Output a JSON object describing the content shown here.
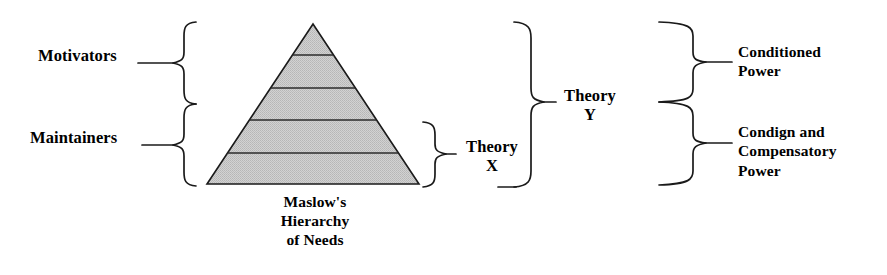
{
  "diagram": {
    "pyramid": {
      "caption": "Maslow's\nHierarchy\nof Needs",
      "levels": 5,
      "fill_color": "#c9c9c9",
      "stroke_color": "#1a1a1a",
      "apex": {
        "x": 313,
        "y": 24
      },
      "base_left": {
        "x": 207,
        "y": 184
      },
      "base_right": {
        "x": 419,
        "y": 184
      },
      "divider_y": [
        55,
        88,
        120,
        153
      ]
    },
    "left_labels": {
      "motivators": "Motivators",
      "maintainers": "Maintainers"
    },
    "middle_labels": {
      "theory_x": "Theory\nX",
      "theory_y": "Theory\nY"
    },
    "right_labels": {
      "conditioned_power": "Conditioned\nPower",
      "condign_power": "Condign and\nCompensatory\nPower"
    },
    "braces": [
      {
        "name": "motivators-brace",
        "orientation": "left-pointing",
        "span_top": 22,
        "span_bottom": 104,
        "tip_y": 63
      },
      {
        "name": "maintainers-brace",
        "orientation": "left-pointing",
        "span_top": 104,
        "span_bottom": 186,
        "tip_y": 145
      },
      {
        "name": "theory-x-brace",
        "orientation": "right-pointing",
        "span_top": 122,
        "span_bottom": 187,
        "tip_y": 154
      },
      {
        "name": "theory-y-brace",
        "orientation": "right-pointing",
        "span_top": 22,
        "span_bottom": 187,
        "tip_y": 102
      },
      {
        "name": "conditioned-power-brace",
        "orientation": "right-pointing",
        "span_top": 22,
        "span_bottom": 102,
        "tip_y": 62
      },
      {
        "name": "condign-power-brace",
        "orientation": "right-pointing",
        "span_top": 102,
        "span_bottom": 185,
        "tip_y": 143
      }
    ],
    "colors": {
      "ink": "#1a1a1a",
      "pyramid_fill": "#c9c9c9",
      "background": "#ffffff"
    }
  }
}
